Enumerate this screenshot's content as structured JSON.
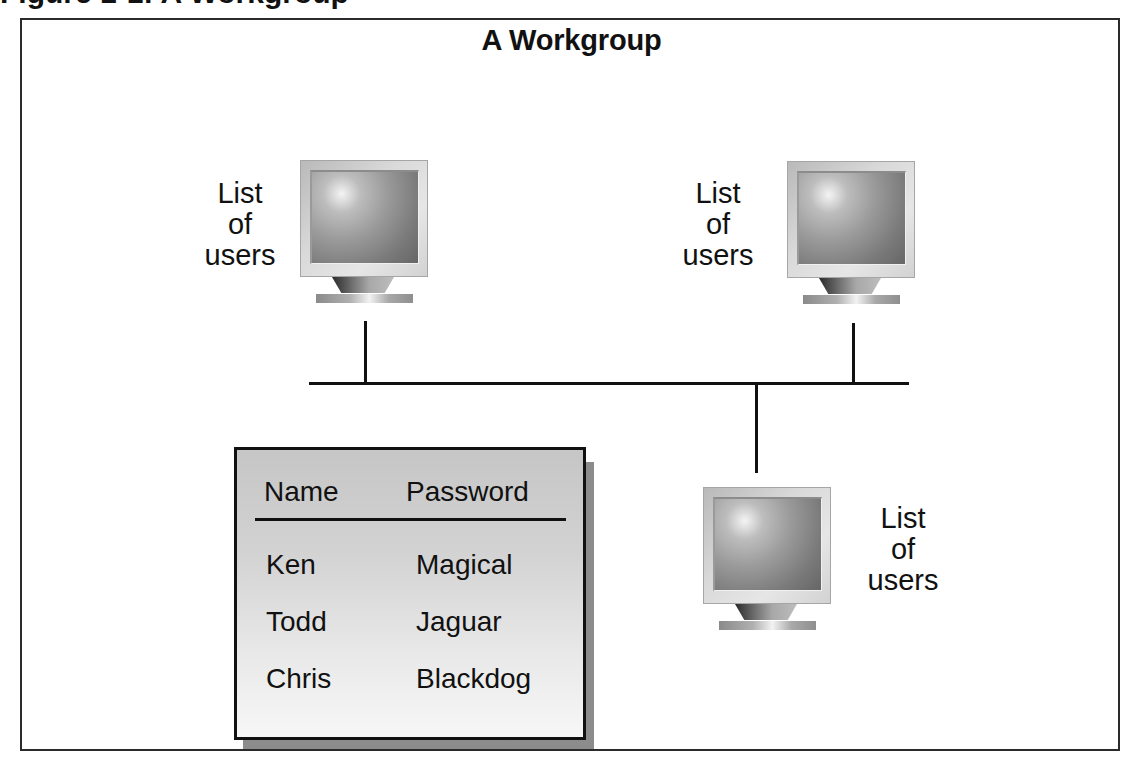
{
  "caption": {
    "text": "Figure 1-1: A Workgroup"
  },
  "diagram": {
    "title": "A Workgroup",
    "nodes": [
      {
        "id": "computer-top-left",
        "label_lines": [
          "List",
          "of",
          "users"
        ]
      },
      {
        "id": "computer-top-right",
        "label_lines": [
          "List",
          "of",
          "users"
        ]
      },
      {
        "id": "computer-bottom",
        "label_lines": [
          "List",
          "of",
          "users"
        ]
      }
    ],
    "connections": [
      {
        "from": "computer-top-left",
        "to": "network-bus"
      },
      {
        "from": "computer-top-right",
        "to": "network-bus"
      },
      {
        "from": "computer-bottom",
        "to": "network-bus"
      }
    ],
    "user_table": {
      "headers": {
        "name": "Name",
        "password": "Password"
      },
      "rows": [
        {
          "name": "Ken",
          "password": "Magical"
        },
        {
          "name": "Todd",
          "password": "Jaguar"
        },
        {
          "name": "Chris",
          "password": "Blackdog"
        }
      ]
    }
  },
  "colors": {
    "line": "#111111",
    "frame": "#2b2b2b",
    "table_shadow": "#8c8c8c",
    "table_fill_top": "#c6c6c6",
    "table_fill_bottom": "#f7f7f7"
  }
}
